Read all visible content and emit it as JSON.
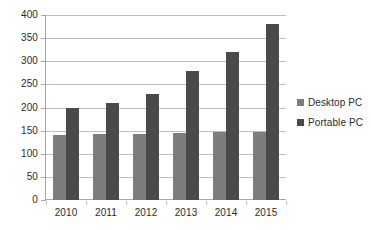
{
  "chart_data": {
    "type": "bar",
    "title": "",
    "subtitle": "",
    "xlabel": "",
    "ylabel": "",
    "categories": [
      "2010",
      "2011",
      "2012",
      "2013",
      "2014",
      "2015"
    ],
    "series": [
      {
        "name": "Desktop PC",
        "color": "#7d7d7d",
        "values": [
          140,
          142,
          143,
          145,
          146,
          147
        ]
      },
      {
        "name": "Portable PC",
        "color": "#4a4a4a",
        "values": [
          200,
          210,
          230,
          280,
          320,
          380
        ]
      }
    ],
    "ylim": [
      0,
      400
    ],
    "ytick_values": [
      0,
      50,
      100,
      150,
      200,
      250,
      300,
      350,
      400
    ],
    "ytick_labels": [
      "0",
      "50",
      "100",
      "150",
      "200",
      "250",
      "300",
      "350",
      "400"
    ],
    "grid": "horizontal",
    "legend_position": "right",
    "legend_entries": [
      "Desktop PC",
      "Portable PC"
    ],
    "background_color": "#ffffff",
    "gridline_color": "#bfbfbf",
    "axis_color": "#a6a6a6",
    "text_color": "#2b2b2b"
  }
}
